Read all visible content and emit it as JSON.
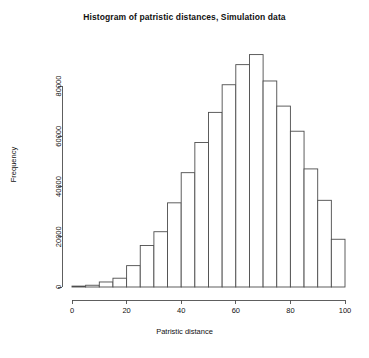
{
  "chart_data": {
    "type": "bar",
    "title": "Histogram of patristic distances, Simulation data",
    "xlabel": "Patristic distance",
    "ylabel": "Frequency",
    "grid": false,
    "legend": null,
    "xlim": [
      0,
      100
    ],
    "ylim": [
      0,
      93000
    ],
    "bin_width": 5,
    "xticks": [
      0,
      20,
      40,
      60,
      80,
      100
    ],
    "xtick_labels": [
      "0",
      "20",
      "40",
      "60",
      "80",
      "100"
    ],
    "yticks": [
      0,
      20000,
      40000,
      60000,
      80000
    ],
    "ytick_labels": [
      "0",
      "20000",
      "40000",
      "60000",
      "80000"
    ],
    "bin_edges": [
      0,
      5,
      10,
      15,
      20,
      25,
      30,
      35,
      40,
      45,
      50,
      55,
      60,
      65,
      70,
      75,
      80,
      85,
      90,
      95,
      100
    ],
    "categories": [
      "0-5",
      "5-10",
      "10-15",
      "15-20",
      "20-25",
      "25-30",
      "30-35",
      "35-40",
      "40-45",
      "45-50",
      "50-55",
      "55-60",
      "60-65",
      "65-70",
      "70-75",
      "75-80",
      "80-85",
      "85-90",
      "90-95",
      "95-100"
    ],
    "values": [
      300,
      700,
      2000,
      3500,
      8500,
      16500,
      22000,
      33500,
      45500,
      57500,
      69500,
      80500,
      88500,
      92500,
      82000,
      72000,
      62000,
      47000,
      34500,
      19000
    ]
  },
  "axis": {
    "x_axis_name": "x-axis",
    "y_axis_name": "y-axis"
  }
}
